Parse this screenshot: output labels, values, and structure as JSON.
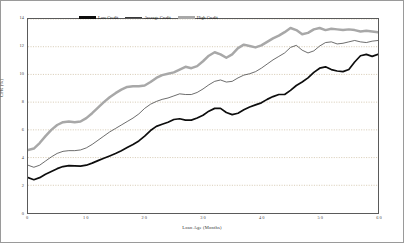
{
  "chart_data": {
    "type": "line",
    "title": "",
    "xlabel": "Loan Age (Months)",
    "ylabel": "CPR (%)",
    "xlim": [
      0,
      60
    ],
    "ylim": [
      0,
      14
    ],
    "xticks": [
      0,
      10,
      20,
      30,
      40,
      50,
      60
    ],
    "xtick_labels": [
      "0",
      "1 0",
      "2 0",
      "3 0",
      "4 0",
      "5 0",
      "6 0"
    ],
    "yticks": [
      0,
      2,
      4,
      6,
      8,
      10,
      12,
      14
    ],
    "ytick_labels": [
      "0",
      "2",
      "4",
      "6",
      "8",
      "10",
      "12",
      "14"
    ],
    "grid": true,
    "grid_axis": "y",
    "legend_position": "top-center",
    "colors": {
      "low_credit": "#0d0d0d",
      "average_credit": "#3a3a3a",
      "high_credit": "#a8a8a8",
      "grid": "#c8b89a",
      "frame": "#5a5a5a",
      "figure_border": "#9a9a9a"
    },
    "x": [
      0,
      1,
      2,
      3,
      4,
      5,
      6,
      7,
      8,
      9,
      10,
      11,
      12,
      13,
      14,
      15,
      16,
      17,
      18,
      19,
      20,
      21,
      22,
      23,
      24,
      25,
      26,
      27,
      28,
      29,
      30,
      31,
      32,
      33,
      34,
      35,
      36,
      37,
      38,
      39,
      40,
      41,
      42,
      43,
      44,
      45,
      46,
      47,
      48,
      49,
      50,
      51,
      52,
      53,
      54,
      55,
      56,
      57,
      58,
      59,
      60
    ],
    "series": [
      {
        "name": "Low Credit",
        "values": [
          2.55,
          2.4,
          2.55,
          2.8,
          3.0,
          3.2,
          3.35,
          3.42,
          3.4,
          3.38,
          3.45,
          3.6,
          3.78,
          3.95,
          4.12,
          4.3,
          4.5,
          4.72,
          4.95,
          5.2,
          5.55,
          5.95,
          6.25,
          6.4,
          6.55,
          6.75,
          6.8,
          6.7,
          6.7,
          6.85,
          7.05,
          7.35,
          7.55,
          7.55,
          7.25,
          7.1,
          7.2,
          7.45,
          7.65,
          7.8,
          7.95,
          8.2,
          8.4,
          8.55,
          8.55,
          8.85,
          9.2,
          9.45,
          9.75,
          10.15,
          10.45,
          10.55,
          10.35,
          10.25,
          10.2,
          10.35,
          10.9,
          11.35,
          11.45,
          11.3,
          11.45
        ]
      },
      {
        "name": "Average Credit",
        "values": [
          3.45,
          3.3,
          3.45,
          3.75,
          4.05,
          4.3,
          4.45,
          4.5,
          4.5,
          4.55,
          4.7,
          4.95,
          5.25,
          5.55,
          5.85,
          6.1,
          6.35,
          6.6,
          6.85,
          7.15,
          7.55,
          7.85,
          8.05,
          8.2,
          8.3,
          8.45,
          8.6,
          8.55,
          8.55,
          8.7,
          8.95,
          9.25,
          9.5,
          9.6,
          9.45,
          9.5,
          9.75,
          9.95,
          10.05,
          10.2,
          10.45,
          10.75,
          11.05,
          11.3,
          11.55,
          11.95,
          12.1,
          11.75,
          11.55,
          11.7,
          12.05,
          12.3,
          12.35,
          12.2,
          12.25,
          12.35,
          12.45,
          12.35,
          12.3,
          12.4,
          12.45
        ]
      },
      {
        "name": "High Credit",
        "values": [
          4.55,
          4.65,
          5.05,
          5.55,
          6.0,
          6.35,
          6.55,
          6.6,
          6.55,
          6.6,
          6.85,
          7.2,
          7.6,
          8.0,
          8.35,
          8.65,
          8.9,
          9.1,
          9.15,
          9.15,
          9.2,
          9.45,
          9.75,
          9.95,
          10.05,
          10.15,
          10.35,
          10.55,
          10.45,
          10.6,
          10.95,
          11.35,
          11.6,
          11.45,
          11.2,
          11.45,
          11.9,
          12.15,
          12.05,
          11.95,
          12.1,
          12.35,
          12.6,
          12.8,
          13.05,
          13.35,
          13.2,
          12.9,
          13.0,
          13.25,
          13.35,
          13.2,
          13.3,
          13.25,
          13.2,
          13.25,
          13.2,
          13.1,
          13.15,
          13.1,
          13.05
        ]
      }
    ]
  },
  "legend": {
    "low_label": "Low Credit",
    "average_label": "Average Credit",
    "high_label": "High Credit"
  }
}
